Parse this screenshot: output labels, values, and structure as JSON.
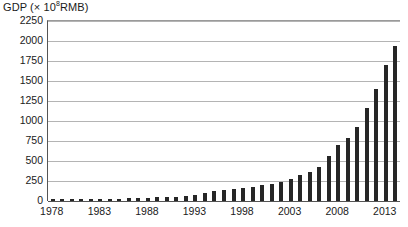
{
  "chart_data": {
    "type": "bar",
    "title": "",
    "ylabel": "GDP (× 10⁸RMB)",
    "ylabel_prefix": "GDP (× 10",
    "ylabel_exponent": "8",
    "ylabel_suffix": "RMB)",
    "xlabel": "",
    "ylim": [
      0,
      2250
    ],
    "ytick_step": 250,
    "yticks": [
      "2250",
      "2000",
      "1750",
      "1500",
      "1250",
      "1000",
      "750",
      "500",
      "250",
      "0"
    ],
    "ytick_values": [
      2250,
      2000,
      1750,
      1500,
      1250,
      1000,
      750,
      500,
      250,
      0
    ],
    "xticks": [
      "1978",
      "1983",
      "1988",
      "1993",
      "1998",
      "2003",
      "2008",
      "2013"
    ],
    "xtick_values": [
      1978,
      1983,
      1988,
      1993,
      1998,
      2003,
      2008,
      2013
    ],
    "xlim": [
      1977.5,
      2014.5
    ],
    "grid": true,
    "legend": false,
    "bar_color": "#262626",
    "grid_color": "#b4b4b4",
    "axis_color": "#555555",
    "categories": [
      1978,
      1979,
      1980,
      1981,
      1982,
      1983,
      1984,
      1985,
      1986,
      1987,
      1988,
      1989,
      1990,
      1991,
      1992,
      1993,
      1994,
      1995,
      1996,
      1997,
      1998,
      1999,
      2000,
      2001,
      2002,
      2003,
      2004,
      2005,
      2006,
      2007,
      2008,
      2009,
      2010,
      2011,
      2012,
      2013,
      2014
    ],
    "values": [
      36,
      41,
      46,
      49,
      54,
      60,
      72,
      90,
      103,
      121,
      151,
      172,
      187,
      219,
      270,
      355,
      482,
      610,
      716,
      792,
      850,
      906,
      997,
      1098,
      1212,
      1403,
      1659,
      1850,
      2160,
      2700,
      3200,
      3500,
      4000,
      4700,
      5200,
      5700,
      6350
    ],
    "values_scaled_note": "bar heights in plotted units (× 10⁸ RMB)",
    "plotted_values": [
      36,
      41,
      46,
      49,
      54,
      60,
      72,
      90,
      103,
      121,
      151,
      172,
      187,
      219,
      270,
      355,
      482,
      610,
      716,
      792,
      850,
      906,
      997,
      1098,
      1212,
      1403,
      1659,
      1850,
      2160,
      2700,
      3200,
      3500,
      4000,
      4700,
      5200,
      5700,
      6350
    ]
  },
  "bars": {
    "years": [
      1978,
      1979,
      1980,
      1981,
      1982,
      1983,
      1984,
      1985,
      1986,
      1987,
      1988,
      1989,
      1990,
      1991,
      1992,
      1993,
      1994,
      1995,
      1996,
      1997,
      1998,
      1999,
      2000,
      2001,
      2002,
      2003,
      2004,
      2005,
      2006,
      2007,
      2008,
      2009,
      2010,
      2011,
      2012,
      2013,
      2014
    ],
    "heights": [
      15,
      16,
      18,
      19,
      21,
      23,
      26,
      30,
      33,
      36,
      42,
      46,
      49,
      55,
      64,
      78,
      100,
      120,
      138,
      152,
      165,
      178,
      196,
      215,
      238,
      275,
      325,
      365,
      430,
      560,
      700,
      790,
      930,
      1160,
      1400,
      1700,
      1940
    ]
  }
}
